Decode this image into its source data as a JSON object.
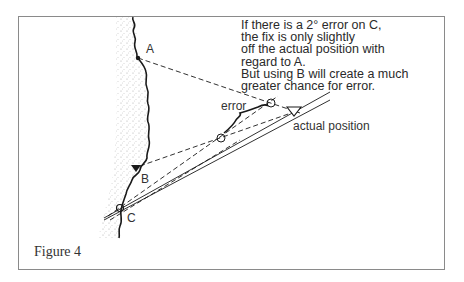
{
  "figure": {
    "caption": "Figure 4",
    "note_lines": [
      "If there is a 2° error on C,",
      "the fix is only slightly",
      "off the actual position with",
      "regard to A.",
      "But using B will create a much",
      "greater chance for error."
    ],
    "labels": {
      "point_a": "A",
      "point_b": "B",
      "point_c": "C",
      "error": "error",
      "actual_position": "actual position"
    },
    "colors": {
      "line": "#1a1a1a",
      "frame": "#8a8a8a",
      "land_stipple": "#9a9a9a"
    }
  }
}
